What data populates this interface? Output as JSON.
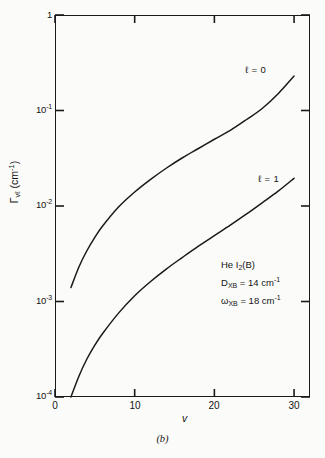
{
  "figure": {
    "caption": "(b)"
  },
  "chart_data": {
    "type": "line",
    "title": "",
    "xlabel": "v",
    "ylabel": "Γ",
    "ylabel_sub": "vℓ",
    "ylabel_units": "(cm",
    "ylabel_units_exp": "-1",
    "ylabel_units_close": ")",
    "xscale": "linear",
    "yscale": "log",
    "xlim": [
      0,
      32
    ],
    "ylim": [
      0.0001,
      1
    ],
    "grid": false,
    "legend_position": "inline-curve-labels",
    "xticks": [
      0,
      10,
      20,
      30
    ],
    "xtick_labels": [
      "0",
      "10",
      "20",
      "30"
    ],
    "yticks": [
      1,
      0.1,
      0.01,
      0.001,
      0.0001
    ],
    "ytick_labels": [
      "1",
      "10",
      "10",
      "10",
      "10"
    ],
    "ytick_exponents": [
      "",
      "-1",
      "-2",
      "-3",
      "-4"
    ],
    "series": [
      {
        "name": "ℓ = 0",
        "label": "ℓ = 0",
        "color": "#1a1a1a",
        "x": [
          2,
          3,
          4,
          5,
          6,
          8,
          10,
          12,
          14,
          16,
          18,
          20,
          22,
          24,
          26,
          28,
          30
        ],
        "y": [
          0.0014,
          0.0023,
          0.0034,
          0.0047,
          0.0062,
          0.0098,
          0.014,
          0.019,
          0.025,
          0.032,
          0.04,
          0.05,
          0.062,
          0.08,
          0.105,
          0.15,
          0.23
        ]
      },
      {
        "name": "ℓ = 1",
        "label": "ℓ = 1",
        "color": "#1a1a1a",
        "x": [
          2,
          3,
          4,
          5,
          6,
          8,
          10,
          12,
          14,
          16,
          18,
          20,
          22,
          24,
          26,
          28,
          30
        ],
        "y": [
          0.0001,
          0.000165,
          0.00025,
          0.00035,
          0.000465,
          0.00076,
          0.00115,
          0.00162,
          0.0022,
          0.0029,
          0.0038,
          0.0049,
          0.0063,
          0.0082,
          0.0108,
          0.0143,
          0.0195
        ]
      }
    ],
    "annotations": [
      {
        "id": "system",
        "prefix": "He I",
        "sub": "2",
        "suffix": "(B)"
      },
      {
        "id": "well-depth",
        "prefix": "D",
        "sub": "XB",
        "mid": " = 14 cm",
        "sup": "-1",
        "suffix": ""
      },
      {
        "id": "frequency",
        "prefix": "ω",
        "sub": "XB",
        "mid": " = 18 cm",
        "sup": "-1",
        "suffix": ""
      }
    ]
  }
}
